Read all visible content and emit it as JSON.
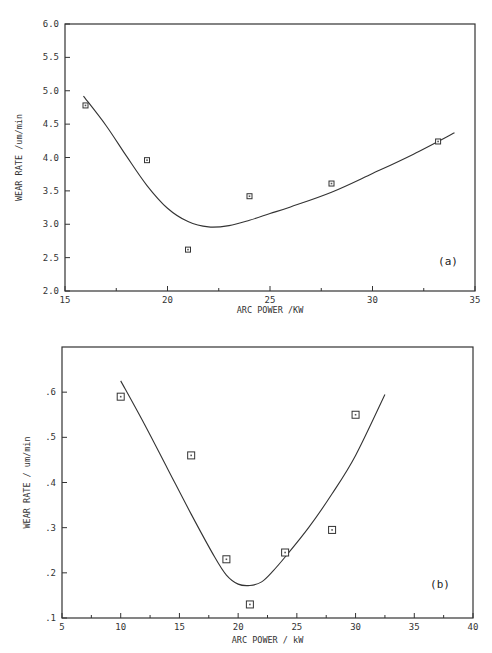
{
  "chart_data": [
    {
      "type": "scatter",
      "panel_label": "(a)",
      "xlabel": "ARC POWER /KW",
      "ylabel": "WEAR RATE /um/min",
      "xlim": [
        15,
        35
      ],
      "ylim": [
        2.0,
        6.0
      ],
      "x_ticks": [
        "15",
        "20",
        "25",
        "30",
        "35"
      ],
      "y_ticks": [
        "2.0",
        "2.5",
        "3.0",
        "3.5",
        "4.0",
        "4.5",
        "5.0",
        "5.5",
        "6.0"
      ],
      "grid": false,
      "series": [
        {
          "name": "measured",
          "marker": "square",
          "x": [
            16,
            19,
            21,
            24,
            28,
            33.2
          ],
          "y": [
            4.78,
            3.96,
            2.62,
            3.42,
            3.61,
            4.24
          ]
        },
        {
          "name": "fit",
          "style": "line",
          "x": [
            15.9,
            17,
            18,
            19,
            20,
            21,
            22,
            23,
            24,
            25,
            26,
            28,
            30,
            32,
            34
          ],
          "y": [
            4.92,
            4.48,
            4.02,
            3.58,
            3.24,
            3.04,
            2.96,
            2.98,
            3.06,
            3.16,
            3.26,
            3.48,
            3.76,
            4.05,
            4.37
          ]
        }
      ]
    },
    {
      "type": "scatter",
      "panel_label": "(b)",
      "xlabel": "ARC POWER / kW",
      "ylabel": "WEAR RATE / um/min",
      "xlim": [
        5,
        40
      ],
      "ylim": [
        0.1,
        0.7
      ],
      "x_ticks": [
        "5",
        "10",
        "15",
        "20",
        "25",
        "30",
        "35",
        "40"
      ],
      "y_ticks": [
        ".1",
        ".2",
        ".3",
        ".4",
        ".5",
        ".6"
      ],
      "grid": false,
      "series": [
        {
          "name": "measured",
          "marker": "square",
          "x": [
            10,
            16,
            19,
            21,
            24,
            28,
            30
          ],
          "y": [
            0.59,
            0.46,
            0.23,
            0.13,
            0.245,
            0.295,
            0.55
          ]
        },
        {
          "name": "fit",
          "style": "line",
          "x": [
            10,
            12,
            14,
            16,
            18,
            19,
            20,
            21,
            22,
            23,
            24,
            26,
            28,
            30,
            32.5
          ],
          "y": [
            0.625,
            0.53,
            0.43,
            0.33,
            0.235,
            0.195,
            0.175,
            0.172,
            0.18,
            0.205,
            0.235,
            0.3,
            0.375,
            0.46,
            0.595
          ]
        }
      ]
    }
  ]
}
